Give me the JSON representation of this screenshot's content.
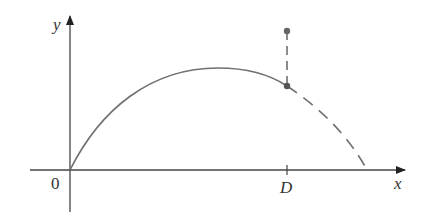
{
  "diagram": {
    "type": "projectile-trajectory",
    "axes": {
      "x_label": "x",
      "y_label": "y",
      "origin_label": "0",
      "tick_label": "D"
    },
    "curve": {
      "solid_description": "parabolic arc from origin to point above D",
      "dashed_description": "continuation of parabola from D down to x-axis",
      "color": "#707070"
    },
    "marker": {
      "vertical_dashed_segment": "from curve point at x = D up to a higher point",
      "point_color": "#666666"
    },
    "colors": {
      "axis": "#444444",
      "curve": "#707070",
      "text": "#333333"
    }
  }
}
